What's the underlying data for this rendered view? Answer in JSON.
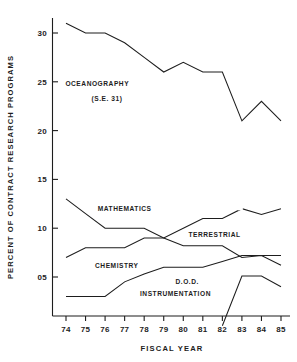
{
  "chart_data": {
    "type": "line",
    "title": "",
    "xlabel": "FISCAL   YEAR",
    "ylabel": "PERCENT  OF  CONTRACT  RESEARCH  PROGRAMS",
    "categories": [
      "74",
      "75",
      "76",
      "77",
      "78",
      "79",
      "80",
      "81",
      "82",
      "83",
      "84",
      "85"
    ],
    "xlim": [
      74,
      85
    ],
    "ylim": [
      0,
      32
    ],
    "yticks": [
      5,
      10,
      15,
      20,
      25,
      30
    ],
    "ytick_labels": [
      "05",
      "10",
      "15",
      "20",
      "25",
      "30"
    ],
    "xtick_labels": [
      "74",
      "75",
      "76",
      "77",
      "78",
      "79",
      "80",
      "81",
      "82",
      "83",
      "84",
      "85"
    ],
    "grid": false,
    "legend": "inline-annotations",
    "series": [
      {
        "name": "OCEANOGRAPHY",
        "label": "OCEANOGRAPHY",
        "sublabel": "(S.E. 31)",
        "x": [
          74,
          75,
          76,
          77,
          78,
          79,
          80,
          81,
          82,
          83,
          84,
          85
        ],
        "values": [
          31,
          30,
          30,
          29,
          27.5,
          26,
          27,
          26,
          26,
          21,
          23,
          21
        ]
      },
      {
        "name": "MATHEMATICS",
        "label": "MATHEMATICS",
        "sublabel": "",
        "x": [
          74,
          75,
          76,
          77,
          78,
          79,
          80,
          81,
          82,
          83,
          84,
          85
        ],
        "values": [
          13,
          11.5,
          10,
          10,
          10,
          9,
          8.2,
          8.2,
          8.2,
          7,
          7.2,
          6.2
        ]
      },
      {
        "name": "TERRESTRIAL",
        "label": "TERRESTRIAL",
        "sublabel": "",
        "x": [
          74,
          75,
          76,
          77,
          78,
          79,
          80,
          81,
          82,
          83,
          84,
          85
        ],
        "values": [
          7,
          8,
          8,
          8,
          9,
          9,
          10,
          11,
          11,
          12,
          11.4,
          12
        ]
      },
      {
        "name": "CHEMISTRY",
        "label": "CHEMISTRY",
        "sublabel": "",
        "x": [
          74,
          75,
          76,
          77,
          78,
          79,
          80,
          81,
          82,
          83,
          84,
          85
        ],
        "values": [
          3,
          3,
          3,
          4.5,
          5.3,
          6,
          6,
          6,
          6.6,
          7.2,
          7.2,
          7.2
        ]
      },
      {
        "name": "D.O.D. INSTRUMENTATION",
        "label": "D.O.D.",
        "sublabel": "INSTRUMENTATION",
        "x": [
          82,
          83,
          84,
          85
        ],
        "values": [
          0,
          5.1,
          5.1,
          4
        ]
      }
    ],
    "annotations": [
      {
        "text": "OCEANOGRAPHY",
        "x": 75.6,
        "y": 24.6
      },
      {
        "text": "(S.E. 31)",
        "x": 76.1,
        "y": 23.0
      },
      {
        "text": "MATHEMATICS",
        "x": 77.0,
        "y": 11.8
      },
      {
        "text": "TERRESTRIAL",
        "x": 81.6,
        "y": 9.1
      },
      {
        "text": "CHEMISTRY",
        "x": 76.6,
        "y": 5.9
      },
      {
        "text": "D.O.D.",
        "x": 80.2,
        "y": 4.3
      },
      {
        "text": "INSTRUMENTATION",
        "x": 79.6,
        "y": 3.1
      }
    ],
    "colors": {
      "line": "#1d1d1d",
      "axis": "#1d1d1d",
      "background": "#ffffff",
      "text": "#1d1d1d"
    }
  }
}
